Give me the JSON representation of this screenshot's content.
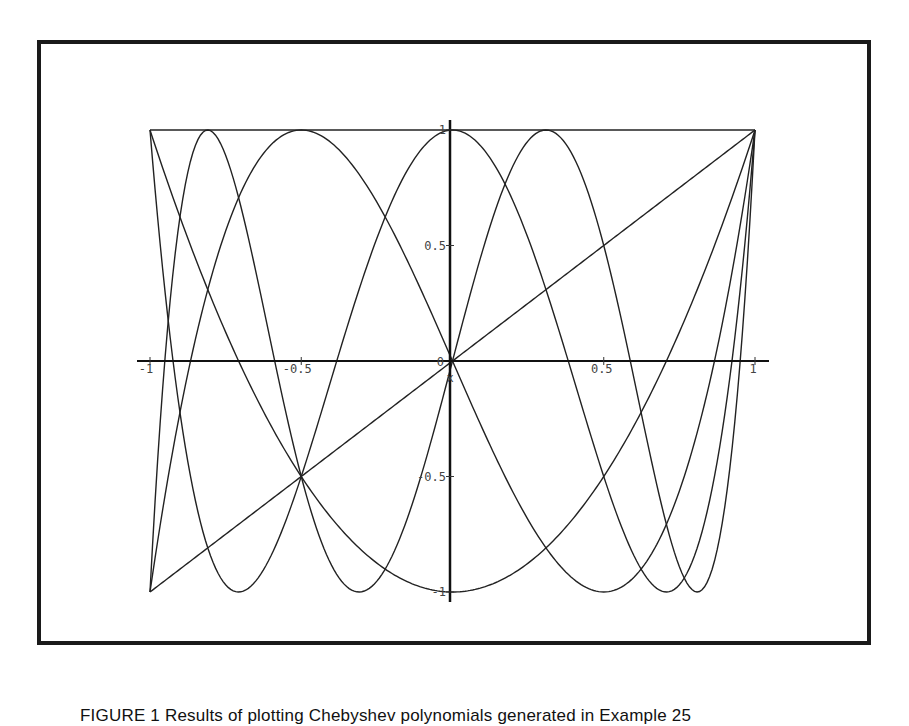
{
  "figure": {
    "caption": "FIGURE 1 Results of plotting Chebyshev polynomials generated in Example 25"
  },
  "chart_data": {
    "type": "line",
    "title": "",
    "xlabel": "x",
    "ylabel": "",
    "xlim": [
      -1,
      1
    ],
    "ylim": [
      -1,
      1
    ],
    "grid": false,
    "legend": null,
    "x_ticks": [
      "-1",
      "-0.5",
      "0",
      "0.5",
      "1"
    ],
    "y_ticks": [
      "-1",
      "-0.5",
      "0.5",
      "1"
    ],
    "series": [
      {
        "name": "T0(x) = 1",
        "degree": 0,
        "coefficients": [
          1
        ]
      },
      {
        "name": "T1(x) = x",
        "degree": 1,
        "coefficients": [
          0,
          1
        ]
      },
      {
        "name": "T2(x) = 2x^2 - 1",
        "degree": 2,
        "coefficients": [
          -1,
          0,
          2
        ]
      },
      {
        "name": "T3(x) = 4x^3 - 3x",
        "degree": 3,
        "coefficients": [
          0,
          -3,
          0,
          4
        ]
      },
      {
        "name": "T4(x) = 8x^4 - 8x^2 + 1",
        "degree": 4,
        "coefficients": [
          1,
          0,
          -8,
          0,
          8
        ]
      },
      {
        "name": "T5(x) = 16x^5 - 20x^3 + 5x",
        "degree": 5,
        "coefficients": [
          0,
          5,
          0,
          -20,
          0,
          16
        ]
      }
    ],
    "line_color": "#222222"
  }
}
